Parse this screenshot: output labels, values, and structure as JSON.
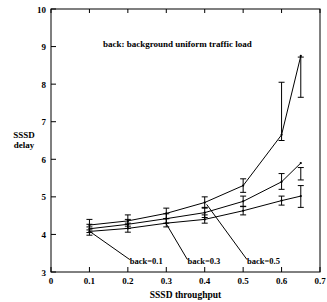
{
  "chart_data": {
    "type": "line",
    "title": "",
    "annotation": "back: background uniform traffic load",
    "xlabel": "SSSD throughput",
    "ylabel_line1": "SSSD",
    "ylabel_line2": "delay",
    "xlim": [
      0,
      0.7
    ],
    "ylim": [
      3,
      10
    ],
    "xticks": [
      "0",
      "0.1",
      "0.2",
      "0.3",
      "0.4",
      "0.5",
      "0.6",
      "0.7"
    ],
    "xtick_values": [
      0,
      0.1,
      0.2,
      0.3,
      0.4,
      0.5,
      0.6,
      0.7
    ],
    "yticks": [
      "3",
      "4",
      "5",
      "6",
      "7",
      "8",
      "9",
      "10"
    ],
    "ytick_values": [
      3,
      4,
      5,
      6,
      7,
      8,
      9,
      10
    ],
    "grid": false,
    "legend": "inline-labels-with-leader-lines",
    "series": [
      {
        "name": "back=0.1",
        "label": "back=0.1",
        "x": [
          0.1,
          0.2,
          0.3,
          0.4,
          0.5,
          0.6,
          0.65
        ],
        "values": [
          4.08,
          4.16,
          4.3,
          4.4,
          4.63,
          4.9,
          5.02
        ],
        "err_low": [
          3.98,
          4.06,
          4.2,
          4.3,
          4.52,
          4.78,
          4.72
        ],
        "err_high": [
          4.2,
          4.3,
          4.42,
          4.52,
          4.75,
          5.02,
          5.3
        ]
      },
      {
        "name": "back=0.3",
        "label": "back=0.3",
        "x": [
          0.1,
          0.2,
          0.3,
          0.4,
          0.5,
          0.6,
          0.65
        ],
        "values": [
          4.15,
          4.27,
          4.42,
          4.58,
          4.88,
          5.4,
          5.9
        ],
        "err_low": [
          4.05,
          4.16,
          4.3,
          4.45,
          4.74,
          5.2,
          5.45
        ],
        "err_high": [
          4.27,
          4.4,
          4.55,
          4.72,
          5.02,
          5.62,
          5.78
        ]
      },
      {
        "name": "back=0.5",
        "label": "back=0.5",
        "x": [
          0.1,
          0.2,
          0.3,
          0.4,
          0.5,
          0.6,
          0.65
        ],
        "values": [
          4.25,
          4.36,
          4.56,
          4.85,
          5.3,
          6.65,
          8.75
        ],
        "err_low": [
          4.12,
          4.22,
          4.42,
          4.7,
          5.12,
          6.5,
          7.65
        ],
        "err_high": [
          4.4,
          4.52,
          4.7,
          5.0,
          5.48,
          8.05,
          8.72
        ]
      }
    ],
    "series_label_anchors": [
      {
        "label": "back=0.1",
        "x": 0.205,
        "y": 3.2
      },
      {
        "label": "back=0.3",
        "x": 0.355,
        "y": 3.2
      },
      {
        "label": "back=0.5",
        "x": 0.51,
        "y": 3.2
      }
    ],
    "annotation_pos": {
      "x": 0.135,
      "y": 9.0
    }
  },
  "colors": {
    "axis": "#000000",
    "curve": "#000000",
    "background": "#ffffff"
  }
}
